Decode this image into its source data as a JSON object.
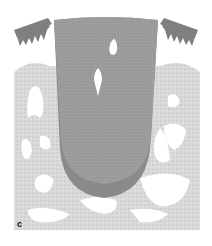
{
  "figure": {
    "panel_label": "c",
    "colors": {
      "background": "#ffffff",
      "root_body": "#9a9a9a",
      "root_apex_layer": "#888888",
      "bone": "#d6d6d6",
      "marrow_spaces": "#ffffff",
      "gingiva": "#7f7f7f"
    }
  }
}
